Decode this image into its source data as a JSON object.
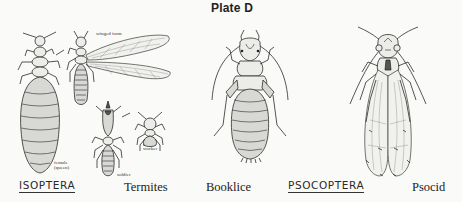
{
  "plate": {
    "title": "Plate D",
    "groups": [
      {
        "order": "ISOPTERA",
        "common_name": "Termites",
        "figures": [
          {
            "id": "queen",
            "caption_line1": "female",
            "caption_line2": "(queen)"
          },
          {
            "id": "winged",
            "caption": "winged form"
          },
          {
            "id": "soldier",
            "caption": "soldier"
          },
          {
            "id": "worker",
            "caption": "worker"
          }
        ]
      },
      {
        "order": "PSOCOPTERA",
        "common_names": [
          "Booklice",
          "Psocid"
        ],
        "figures": [
          {
            "id": "booklouse",
            "caption": "Booklice"
          },
          {
            "id": "psocid",
            "caption": "Psocid"
          }
        ]
      }
    ]
  },
  "colors": {
    "background": "#fafaf8",
    "ink": "#2b2b2b",
    "shade": "#d8d8d4"
  }
}
